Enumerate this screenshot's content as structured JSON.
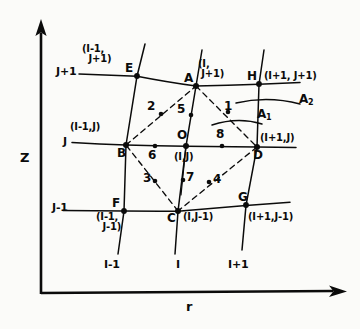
{
  "figure": {
    "domain_type": "diagram",
    "background_color": "#fbfbf9",
    "ink_color": "#0b0b0b"
  },
  "axes": {
    "vertical": {
      "label": "Z",
      "x": 20,
      "y": 158
    },
    "horizontal": {
      "label": "r",
      "x": 186,
      "y": 308
    }
  },
  "row_labels": [
    {
      "id": "row-j-plus-1",
      "text": "J+1",
      "x": 56,
      "y": 72
    },
    {
      "id": "row-j",
      "text": "J",
      "x": 62,
      "y": 140
    },
    {
      "id": "row-j-minus-1",
      "text": "J-1",
      "x": 52,
      "y": 205
    }
  ],
  "column_labels": [
    {
      "id": "col-i-minus-1",
      "text": "I-1",
      "x": 111,
      "y": 266
    },
    {
      "id": "col-i",
      "text": "I",
      "x": 178,
      "y": 266
    },
    {
      "id": "col-i-plus-1",
      "text": "I+1",
      "x": 234,
      "y": 266
    }
  ],
  "nodes": [
    {
      "id": "E",
      "letter": "E",
      "x": 137,
      "y": 76,
      "letter_x": 125,
      "letter_y": 66,
      "index_label": "(I-1,\n  J+1)",
      "index_x": 85,
      "index_y": 46
    },
    {
      "id": "A",
      "letter": "A",
      "x": 196,
      "y": 86,
      "letter_x": 184,
      "letter_y": 75,
      "index_label": "(I,\n J+1)",
      "index_x": 200,
      "index_y": 60
    },
    {
      "id": "H",
      "letter": "H",
      "x": 259,
      "y": 84,
      "letter_x": 247,
      "letter_y": 73,
      "index_label": "(I+1, J+1)",
      "index_x": 265,
      "index_y": 74
    },
    {
      "id": "B",
      "letter": "B",
      "x": 126,
      "y": 145,
      "letter_x": 117,
      "letter_y": 146,
      "index_label": "(I-1,J)",
      "index_x": 71,
      "index_y": 125
    },
    {
      "id": "O",
      "letter": "O",
      "x": 186,
      "y": 146,
      "letter_x": 177,
      "letter_y": 131,
      "index_label": "(I,J)",
      "index_x": 176,
      "index_y": 153
    },
    {
      "id": "D",
      "letter": "D",
      "x": 257,
      "y": 147,
      "letter_x": 253,
      "letter_y": 149,
      "index_label": "(I+1,J)",
      "index_x": 261,
      "index_y": 135
    },
    {
      "id": "F",
      "letter": "F",
      "x": 124,
      "y": 211,
      "letter_x": 113,
      "letter_y": 200,
      "index_label": "(I-1,\n  J-1)",
      "index_x": 98,
      "index_y": 213
    },
    {
      "id": "C",
      "letter": "C",
      "x": 178,
      "y": 211,
      "letter_x": 168,
      "letter_y": 213,
      "index_label": "(I,J-1)",
      "index_x": 184,
      "index_y": 213
    },
    {
      "id": "G",
      "letter": "G",
      "x": 246,
      "y": 205,
      "letter_x": 238,
      "letter_y": 194,
      "index_label": "(I+1,J-1)",
      "index_x": 249,
      "index_y": 213
    }
  ],
  "midpoints": [
    {
      "id": "p1",
      "label": "1",
      "dot_x": 228,
      "dot_y": 112,
      "label_x": 224,
      "label_y": 104
    },
    {
      "id": "p2",
      "label": "2",
      "dot_x": 161,
      "dot_y": 114,
      "label_x": 148,
      "label_y": 104
    },
    {
      "id": "p3",
      "label": "3",
      "dot_x": 155,
      "dot_y": 181,
      "label_x": 144,
      "label_y": 175
    },
    {
      "id": "p4",
      "label": "4",
      "dot_x": 209,
      "dot_y": 182,
      "label_x": 214,
      "label_y": 176
    },
    {
      "id": "p5",
      "label": "5",
      "dot_x": 191,
      "dot_y": 115,
      "label_x": 178,
      "label_y": 107
    },
    {
      "id": "p6",
      "label": "6",
      "dot_x": 155,
      "dot_y": 146,
      "label_x": 149,
      "label_y": 150
    },
    {
      "id": "p7",
      "label": "7",
      "dot_x": 183,
      "dot_y": 180,
      "label_x": 186,
      "label_y": 174
    },
    {
      "id": "p8",
      "label": "8",
      "dot_x": 222,
      "dot_y": 146,
      "label_x": 217,
      "label_y": 131
    }
  ],
  "area_annotations": [
    {
      "id": "A1",
      "base": "A",
      "sub": "1",
      "x": 258,
      "y": 112
    },
    {
      "id": "A2",
      "base": "A",
      "sub": "2",
      "x": 300,
      "y": 98
    }
  ]
}
